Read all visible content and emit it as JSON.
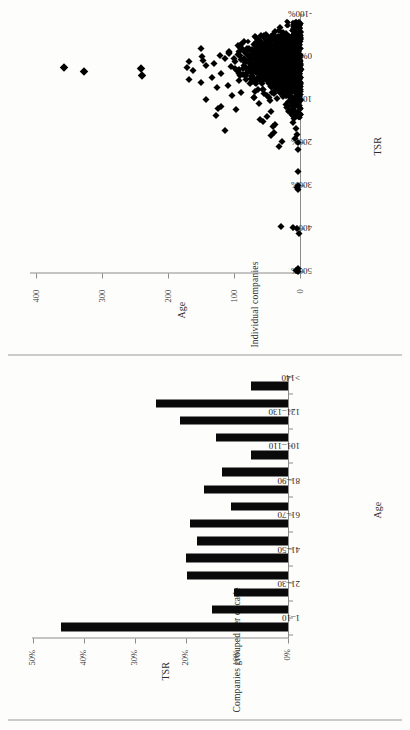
{
  "figure": {
    "panels": [
      {
        "id": "scatter",
        "side_label": "Individual companies",
        "chart_index": 0
      },
      {
        "id": "bars",
        "side_label": "Companies grouped per decade",
        "chart_index": 1
      }
    ]
  },
  "chart_data": [
    {
      "type": "scatter",
      "title": "",
      "xlabel": "TSR",
      "ylabel": "Age",
      "xlim": [
        -100,
        500
      ],
      "xtick_labels": [
        "500%",
        "400%",
        "300%",
        "200%",
        "100%",
        "0%",
        "-100%"
      ],
      "xticks": [
        500,
        400,
        300,
        200,
        100,
        0,
        -100
      ],
      "x_axis_reversed": true,
      "ylim": [
        0,
        400
      ],
      "ytick_labels": [
        "0",
        "100",
        "200",
        "300",
        "400"
      ],
      "yticks": [
        0,
        100,
        200,
        300,
        400
      ],
      "grid": false,
      "legend": null,
      "marker": "diamond",
      "marker_color": "#000000",
      "n_points_approx": 1600,
      "description": "Dense cluster of companies near 0% TSR with ages 0-170; sparse outliers at high TSR (200-500%) almost all with low age; a few very old companies (235, 235, 320, 350 years) near 0-40% TSR.",
      "points": [
        [
          495,
          5
        ],
        [
          492,
          8
        ],
        [
          488,
          4
        ],
        [
          408,
          3
        ],
        [
          396,
          6
        ],
        [
          392,
          12
        ],
        [
          390,
          30
        ],
        [
          305,
          4
        ],
        [
          300,
          6
        ],
        [
          296,
          5
        ],
        [
          262,
          4
        ],
        [
          212,
          4
        ],
        [
          205,
          32
        ],
        [
          196,
          5
        ],
        [
          193,
          28
        ],
        [
          186,
          9
        ],
        [
          180,
          44
        ],
        [
          176,
          6
        ],
        [
          172,
          40
        ],
        [
          168,
          112
        ],
        [
          163,
          8
        ],
        [
          158,
          41
        ],
        [
          154,
          38
        ],
        [
          150,
          12
        ],
        [
          146,
          56
        ],
        [
          142,
          60
        ],
        [
          140,
          10
        ],
        [
          136,
          50
        ],
        [
          132,
          126
        ],
        [
          128,
          14
        ],
        [
          124,
          44
        ],
        [
          120,
          18
        ],
        [
          118,
          96
        ],
        [
          116,
          122
        ],
        [
          112,
          118
        ],
        [
          108,
          22
        ],
        [
          104,
          62
        ],
        [
          100,
          16
        ],
        [
          98,
          46
        ],
        [
          95,
          140
        ],
        [
          92,
          36
        ],
        [
          90,
          70
        ],
        [
          88,
          26
        ],
        [
          85,
          102
        ],
        [
          82,
          54
        ],
        [
          80,
          30
        ],
        [
          78,
          88
        ],
        [
          75,
          20
        ],
        [
          72,
          64
        ],
        [
          70,
          34
        ],
        [
          68,
          124
        ],
        [
          65,
          44
        ],
        [
          62,
          108
        ],
        [
          60,
          28
        ],
        [
          58,
          76
        ],
        [
          56,
          148
        ],
        [
          54,
          38
        ],
        [
          52,
          92
        ],
        [
          50,
          24
        ],
        [
          48,
          166
        ],
        [
          46,
          58
        ],
        [
          44,
          132
        ],
        [
          42,
          40
        ],
        [
          40,
          235
        ],
        [
          38,
          86
        ],
        [
          36,
          50
        ],
        [
          34,
          118
        ],
        [
          32,
          66
        ],
        [
          30,
          320
        ],
        [
          28,
          160
        ],
        [
          26,
          74
        ],
        [
          24,
          236
        ],
        [
          22,
          168
        ],
        [
          20,
          350
        ],
        [
          18,
          104
        ],
        [
          16,
          140
        ],
        [
          14,
          56
        ],
        [
          12,
          128
        ],
        [
          10,
          82
        ],
        [
          8,
          166
        ],
        [
          6,
          98
        ],
        [
          4,
          144
        ],
        [
          2,
          60
        ],
        [
          0,
          112
        ],
        [
          -2,
          70
        ],
        [
          -4,
          146
        ],
        [
          -6,
          90
        ],
        [
          -8,
          120
        ],
        [
          -10,
          52
        ],
        [
          -12,
          106
        ],
        [
          -14,
          66
        ],
        [
          -16,
          84
        ],
        [
          -18,
          44
        ],
        [
          -20,
          56
        ],
        [
          -24,
          148
        ],
        [
          -28,
          36
        ],
        [
          -32,
          58
        ],
        [
          -36,
          26
        ],
        [
          -40,
          18
        ],
        [
          -44,
          12
        ],
        [
          -48,
          8
        ],
        [
          -52,
          6
        ],
        [
          -56,
          4
        ]
      ]
    },
    {
      "type": "bar",
      "title": "",
      "xlabel": "Age",
      "ylabel": "TSR",
      "categories": [
        "1-10",
        "11-20",
        "21-30",
        "31-40",
        "41-50",
        "51-60",
        "61-70",
        "71-80",
        "81-90",
        "91-100",
        "101-110",
        "111-120",
        "121-130",
        "131-140",
        ">140"
      ],
      "tick_labels_shown": [
        "1–10",
        "21–30",
        "41–50",
        "61–70",
        "81–90",
        "101–110",
        "121–130",
        ">140"
      ],
      "values": [
        44.5,
        15.0,
        10.5,
        19.9,
        20.0,
        17.8,
        19.3,
        11.2,
        16.5,
        13.0,
        7.2,
        14.2,
        21.2,
        25.9,
        7.2
      ],
      "value_unit": "%",
      "ylim": [
        0,
        50
      ],
      "ytick_labels": [
        "0%",
        "10%",
        "20%",
        "30%",
        "40%",
        "50%"
      ],
      "yticks": [
        0,
        10,
        20,
        30,
        40,
        50
      ],
      "grid": false,
      "legend": null,
      "bar_color": "#0a0a0a"
    }
  ]
}
